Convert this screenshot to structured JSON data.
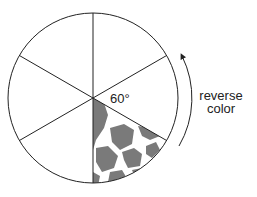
{
  "diagram": {
    "angle_label": "60°",
    "side_label_line1": "reverse",
    "side_label_line2": "color",
    "sectors": 6,
    "shaded_sector_fill": "#7a7a7a",
    "line_color": "#222222"
  }
}
